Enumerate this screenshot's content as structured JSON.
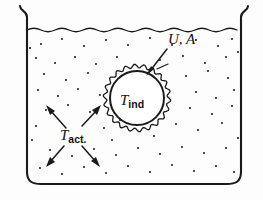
{
  "figure": {
    "background_color": "#fdfdfd",
    "ink_color": "#1a1a1a",
    "hatch_color": "#6e6e6e"
  },
  "labels": {
    "coefficient": {
      "text": "U, A",
      "style": "italic",
      "x": 168,
      "y": 44
    },
    "sphere_temperature": {
      "symbol": "T",
      "subscript": "ind",
      "x": 122,
      "y": 104
    },
    "bulk_temperature": {
      "symbol": "T",
      "subscript": "act.",
      "x": 62,
      "y": 138
    }
  },
  "vessel": {
    "left_wall_x": 27,
    "right_wall_x": 241,
    "top_y": 6,
    "bottom_y": 184,
    "corner_radius": 12,
    "lip_flare": "outward-curl",
    "liquid_surface_y": 30,
    "liquid_surface_style": "wavy"
  },
  "sphere": {
    "center_x": 137,
    "center_y": 98,
    "core_radius": 27,
    "shell_radius": 32,
    "shell_style": "scalloped",
    "fill_style": "diagonal-hatching",
    "hatch_angle_deg": 45
  },
  "leader_arrow": {
    "from_x": 166,
    "from_y": 50,
    "to_x": 148,
    "to_y": 73,
    "points_to": "sphere-shell"
  },
  "agitation_arrows": {
    "count": 4,
    "directions": [
      "up-left",
      "up-right",
      "down-left",
      "down-right"
    ],
    "center_x": 72,
    "center_y": 133
  },
  "stipple": {
    "description": "scattered dots representing agitated liquid",
    "dot_radius": 1.05,
    "points": [
      [
        41,
        44
      ],
      [
        62,
        39
      ],
      [
        84,
        46
      ],
      [
        106,
        40
      ],
      [
        128,
        45
      ],
      [
        150,
        38
      ],
      [
        172,
        45
      ],
      [
        196,
        40
      ],
      [
        218,
        46
      ],
      [
        232,
        39
      ],
      [
        36,
        58
      ],
      [
        55,
        63
      ],
      [
        75,
        57
      ],
      [
        96,
        64
      ],
      [
        117,
        57
      ],
      [
        160,
        60
      ],
      [
        183,
        56
      ],
      [
        205,
        63
      ],
      [
        226,
        57
      ],
      [
        44,
        74
      ],
      [
        66,
        80
      ],
      [
        88,
        73
      ],
      [
        186,
        76
      ],
      [
        208,
        71
      ],
      [
        228,
        78
      ],
      [
        38,
        90
      ],
      [
        58,
        96
      ],
      [
        78,
        89
      ],
      [
        100,
        95
      ],
      [
        196,
        92
      ],
      [
        216,
        98
      ],
      [
        234,
        90
      ],
      [
        46,
        110
      ],
      [
        68,
        105
      ],
      [
        90,
        112
      ],
      [
        190,
        108
      ],
      [
        212,
        114
      ],
      [
        232,
        106
      ],
      [
        36,
        126
      ],
      [
        104,
        128
      ],
      [
        176,
        124
      ],
      [
        198,
        130
      ],
      [
        222,
        123
      ],
      [
        50,
        150
      ],
      [
        72,
        156
      ],
      [
        94,
        149
      ],
      [
        116,
        155
      ],
      [
        138,
        148
      ],
      [
        160,
        154
      ],
      [
        182,
        147
      ],
      [
        204,
        153
      ],
      [
        226,
        148
      ],
      [
        40,
        168
      ],
      [
        62,
        174
      ],
      [
        84,
        167
      ],
      [
        106,
        173
      ],
      [
        128,
        166
      ],
      [
        150,
        172
      ],
      [
        172,
        165
      ],
      [
        194,
        171
      ],
      [
        216,
        166
      ],
      [
        234,
        172
      ],
      [
        30,
        48
      ],
      [
        238,
        52
      ],
      [
        32,
        140
      ],
      [
        238,
        138
      ],
      [
        120,
        120
      ],
      [
        154,
        136
      ],
      [
        158,
        88
      ],
      [
        112,
        140
      ]
    ]
  }
}
